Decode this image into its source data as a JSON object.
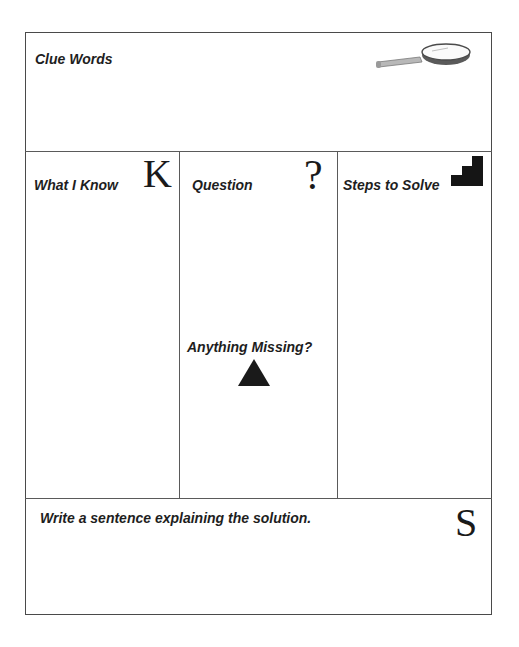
{
  "clue_words": {
    "label": "Clue Words",
    "icon": "magnifying-glass-icon"
  },
  "what_i_know": {
    "label": "What I Know",
    "letter": "K"
  },
  "question": {
    "label": "Question",
    "letter": "?"
  },
  "steps_to_solve": {
    "label": "Steps to Solve",
    "icon": "stairs-icon"
  },
  "anything_missing": {
    "label": "Anything Missing?",
    "icon": "triangle-icon"
  },
  "solution": {
    "label": "Write a sentence explaining the solution.",
    "letter": "S"
  }
}
